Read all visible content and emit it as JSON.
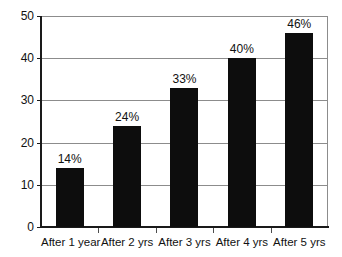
{
  "chart_data": {
    "type": "bar",
    "title": "",
    "subtitle": "",
    "xlabel": "",
    "ylabel": "",
    "categories": [
      "After 1 year",
      "After 2 yrs",
      "After 3 yrs",
      "After 4 yrs",
      "After 5 yrs"
    ],
    "values": [
      14,
      24,
      33,
      40,
      46
    ],
    "data_labels": [
      "14%",
      "24%",
      "33%",
      "40%",
      "46%"
    ],
    "ylim": [
      0,
      50
    ],
    "ytick_values": [
      0,
      10,
      20,
      30,
      40,
      50
    ],
    "ytick_labels": [
      "0",
      "10",
      "20",
      "30",
      "40",
      "50"
    ],
    "grid": true,
    "grid_axis": "y",
    "legend": false,
    "legend_position": "none",
    "bar_color": "#0d0d0d",
    "grid_color": "#8c8c8c",
    "axis_color": "#1a1a1a",
    "background_color": "#ffffff",
    "text_color": "#111111"
  }
}
